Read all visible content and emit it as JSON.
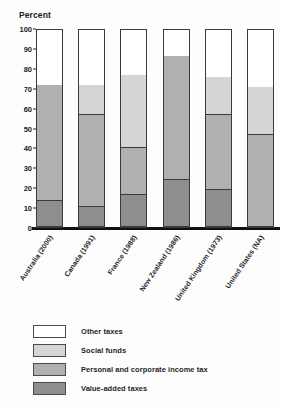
{
  "chart_data": {
    "type": "bar",
    "subtype": "stacked-100-percent",
    "title": "",
    "ylabel": "Percent",
    "xlabel": "",
    "ylim": [
      0,
      100
    ],
    "yticks": [
      0,
      10,
      20,
      30,
      40,
      50,
      60,
      70,
      80,
      90,
      100
    ],
    "grid": false,
    "legend_position": "below-plot",
    "categories": [
      "Australia (2000)",
      "Canada (1991)",
      "France (1988)",
      "New Zealand (1986)",
      "United Kingdom (1973)",
      "United States (NA)"
    ],
    "series": [
      {
        "name": "Value-added taxes",
        "color": "#8e8e8c",
        "values": [
          13,
          10,
          16.5,
          24,
          19,
          0
        ]
      },
      {
        "name": "Personal and corporate income tax",
        "color": "#b0b0ae",
        "values": [
          59,
          47,
          23.5,
          63,
          38,
          46.5
        ]
      },
      {
        "name": "Social funds",
        "color": "#d5d5d3",
        "values": [
          0,
          15,
          37,
          0,
          19,
          24.5
        ]
      },
      {
        "name": "Other taxes",
        "color": "#ffffff",
        "values": [
          28,
          28,
          23,
          13,
          24,
          29
        ]
      }
    ]
  },
  "axis": {
    "y_title": "Percent",
    "tick_100": "100",
    "tick_90": "90",
    "tick_80": "80",
    "tick_70": "70",
    "tick_60": "60",
    "tick_50": "50",
    "tick_40": "40",
    "tick_30": "30",
    "tick_20": "20",
    "tick_10": "10",
    "tick_0": "0"
  },
  "xlabels": [
    "Australia (2000)",
    "Canada (1991)",
    "France (1988)",
    "New Zealand (1986)",
    "United Kingdom (1973)",
    "United States (NA)"
  ],
  "legend": {
    "items": [
      {
        "label": "Other taxes",
        "swatch": "#ffffff"
      },
      {
        "label": "Social funds",
        "swatch": "#d5d5d3"
      },
      {
        "label": "Personal and corporate income tax",
        "swatch": "#b0b0ae"
      },
      {
        "label": "Value-added taxes",
        "swatch": "#8e8e8c"
      }
    ]
  }
}
